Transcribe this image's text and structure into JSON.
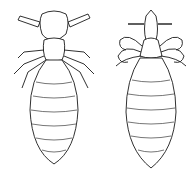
{
  "image": {
    "description": "Line drawing of two lice, dorsal view",
    "subjects": [
      {
        "name": "louse-left",
        "description": "louse with broad head and antennae"
      },
      {
        "name": "louse-right",
        "description": "louse with narrow pointed head and clawed legs"
      }
    ],
    "colors": {
      "background": "#ffffff",
      "ink": "#1a1a1a"
    }
  }
}
